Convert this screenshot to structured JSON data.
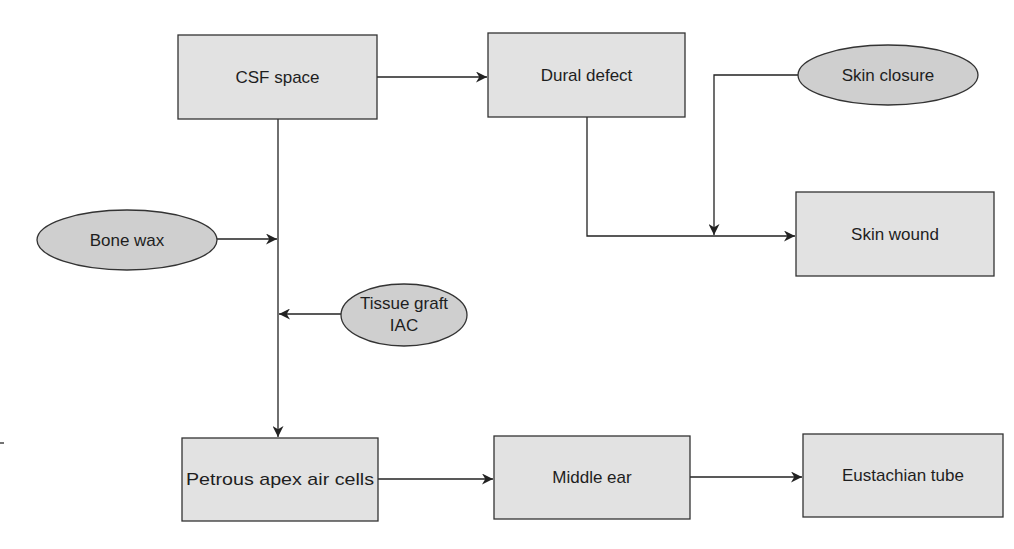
{
  "diagram": {
    "type": "flowchart",
    "nodes": {
      "csf_space": {
        "label": "CSF space",
        "shape": "rectangle"
      },
      "dural_defect": {
        "label": "Dural defect",
        "shape": "rectangle"
      },
      "skin_closure": {
        "label": "Skin closure",
        "shape": "ellipse"
      },
      "skin_wound": {
        "label": "Skin wound",
        "shape": "rectangle"
      },
      "bone_wax": {
        "label": "Bone wax",
        "shape": "ellipse"
      },
      "tissue_graft": {
        "label_line1": "Tissue graft",
        "label_line2": "IAC",
        "shape": "ellipse"
      },
      "petrous_apex": {
        "label": "Petrous apex air cells",
        "shape": "rectangle"
      },
      "middle_ear": {
        "label": "Middle ear",
        "shape": "rectangle"
      },
      "eustachian_tube": {
        "label": "Eustachian tube",
        "shape": "rectangle"
      }
    },
    "edges": [
      {
        "from": "CSF space",
        "to": "Dural defect"
      },
      {
        "from": "Dural defect",
        "to": "Skin wound"
      },
      {
        "from": "Skin closure",
        "to": "Dural defect → Skin wound path"
      },
      {
        "from": "CSF space",
        "to": "Petrous apex air cells"
      },
      {
        "from": "Bone wax",
        "to": "CSF space → Petrous apex air cells path"
      },
      {
        "from": "Tissue graft IAC",
        "to": "CSF space → Petrous apex air cells path"
      },
      {
        "from": "Petrous apex air cells",
        "to": "Middle ear"
      },
      {
        "from": "Middle ear",
        "to": "Eustachian tube"
      }
    ],
    "colors": {
      "box_fill": "#e2e2e2",
      "ellipse_fill": "#cfcfcf",
      "stroke": "#333333",
      "text": "#1e1e1e"
    }
  }
}
